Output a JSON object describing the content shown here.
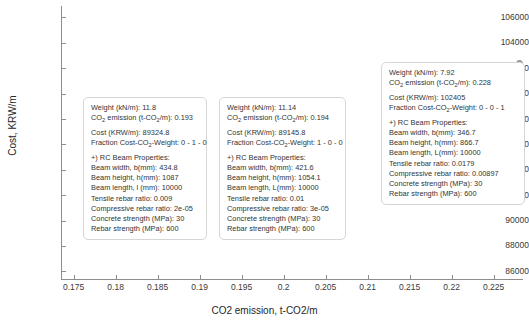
{
  "chart_data": {
    "type": "scatter",
    "title": "",
    "xlabel": "CO2 emission, t-CO2/m",
    "ylabel": "Cost, KRW/m",
    "xlim": [
      0.1735,
      0.2285
    ],
    "ylim": [
      85400,
      106900
    ],
    "xticks": [
      "0.175",
      "0.18",
      "0.185",
      "0.19",
      "0.195",
      "0.2",
      "0.205",
      "0.21",
      "0.215",
      "0.22",
      "0.225"
    ],
    "xtick_values": [
      0.175,
      0.18,
      0.185,
      0.19,
      0.195,
      0.2,
      0.205,
      0.21,
      0.215,
      0.22,
      0.225
    ],
    "yticks": [
      "86000",
      "88000",
      "90000",
      "92000",
      "94000",
      "96000",
      "98000",
      "100000",
      "102000",
      "104000",
      "106000"
    ],
    "ytick_values": [
      86000,
      88000,
      90000,
      92000,
      94000,
      96000,
      98000,
      100000,
      102000,
      104000,
      106000
    ],
    "grid": false,
    "legend": "none",
    "marker_color": "#9a9a9a",
    "points": [
      {
        "x": 0.193,
        "y": 89324.8
      },
      {
        "x": 0.194,
        "y": 89145.8
      },
      {
        "x": 0.228,
        "y": 102405
      }
    ]
  },
  "axis": {
    "xlabel": "CO2 emission, t-CO2/m",
    "ylabel": "Cost, KRW/m"
  },
  "tooltips": [
    {
      "weight_label": "Weight (kN/m): 11.8",
      "co2_pre": "CO",
      "co2_sub": "2",
      "co2_mid": " emission (t-CO",
      "co2_sub2": "2",
      "co2_post": "/m): 0.193",
      "cost_label": "Cost (KRW/m): 89324.8",
      "fraction_pre": "Fraction Cost-CO",
      "fraction_sub": "2",
      "fraction_post": "-Weight: 0 - 1 - 0",
      "props_header": "+) RC Beam Properties:",
      "beam_width": "Beam width, b(mm): 434.8",
      "beam_height": "Beam height, h(mm): 1087",
      "beam_length": "Beam length, l (mm): 10000",
      "tensile": "Tensile rebar ratio: 0.009",
      "compressive": "Compressive rebar ratio: 2e-05",
      "concrete": "Concrete strength (MPa): 30",
      "rebar": "Rebar strength (MPa): 600"
    },
    {
      "weight_label": "Weight (kN/m): 11.14",
      "co2_pre": "CO",
      "co2_sub": "2",
      "co2_mid": " emission (t-CO",
      "co2_sub2": "2",
      "co2_post": "/m): 0.194",
      "cost_label": "Cost (KRW/m): 89145.8",
      "fraction_pre": "Fraction Cost-CO",
      "fraction_sub": "2",
      "fraction_post": "-Weight: 1 - 0 - 0",
      "props_header": "+) RC Beam Properties:",
      "beam_width": "Beam width, b(mm): 421.6",
      "beam_height": "Beam height, h(mm): 1054.1",
      "beam_length": "Beam length, L(mm): 10000",
      "tensile": "Tensile rebar ratio: 0.01",
      "compressive": "Compressive rebar ratio: 3e-05",
      "concrete": "Concrete strength (MPa): 30",
      "rebar": "Rebar strength (MPa): 600"
    },
    {
      "weight_label": "Weight (kN/m): 7.92",
      "co2_pre": "CO",
      "co2_sub": "2",
      "co2_mid": " emission (t-CO",
      "co2_sub2": "2",
      "co2_post": "/m): 0.228",
      "cost_label": "Cost (KRW/m): 102405",
      "fraction_pre": "Fraction Cost-CO",
      "fraction_sub": "2",
      "fraction_post": "-Weight: 0 - 0 - 1",
      "props_header": "+) RC Beam Properties:",
      "beam_width": "Beam width, b(mm): 346.7",
      "beam_height": "Beam height, h(mm): 866.7",
      "beam_length": "Beam length, L(mm): 10000",
      "tensile": "Tensile rebar ratio: 0.0179",
      "compressive": "Compressive rebar ratio: 0.00897",
      "concrete": "Concrete strength (MPa): 30",
      "rebar": "Rebar strength (MPa): 600"
    }
  ]
}
